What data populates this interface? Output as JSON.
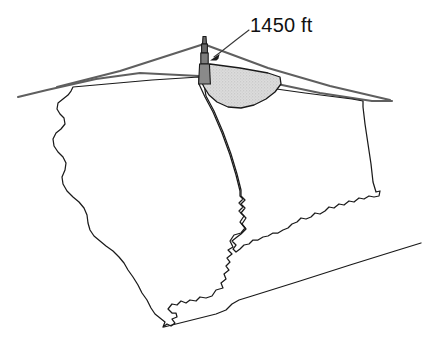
{
  "figure": {
    "background_color": "#ffffff"
  },
  "callout": {
    "label": "1450 ft",
    "text_color": "#111111",
    "points_to": "broadcast-tower"
  },
  "tower": {
    "name": "broadcast-tower",
    "fill_color": "#808080",
    "outline_color": "#1a1a1a",
    "segments": 4
  },
  "coverage": {
    "name": "signal-coverage-footprint",
    "fill_color": "#d8d8d8",
    "outline_color": "#1a1a1a",
    "texture": "stipple"
  },
  "regions": [
    {
      "name": "illinois-outline",
      "stroke_color": "#1a1a1a"
    },
    {
      "name": "indiana-outline",
      "stroke_color": "#1a1a1a"
    }
  ],
  "horizon": {
    "name": "perspective-horizon-lines",
    "stroke_color": "#5f5f5f",
    "line_count": 3
  },
  "kentucky_border": {
    "name": "southern-border-line",
    "stroke_color": "#1a1a1a"
  }
}
